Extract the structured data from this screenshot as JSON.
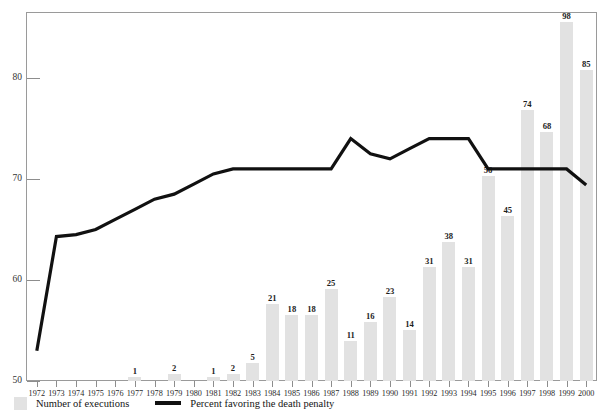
{
  "figure": {
    "top_strip_text": "",
    "background_color": "#ffffff",
    "frame_color": "#9a9a9a"
  },
  "legend": {
    "bar_swatch_name": "executions-swatch",
    "bar_label": "Number of executions",
    "line_swatch_name": "percent-line-swatch",
    "line_label": "Percent favoring the death penalty"
  },
  "colors": {
    "bar_fill": "#e2e2e2",
    "line_stroke": "#111111",
    "axis": "#8d8d8d",
    "text": "#1d1d1d"
  },
  "chart_data": {
    "type": "bar",
    "title": "",
    "subtitle": "",
    "xlabel": "",
    "ylabel": "",
    "grid": false,
    "legend_position": "bottom-left",
    "ylim": [
      50,
      86.5
    ],
    "yticks": [
      50,
      60,
      70,
      80
    ],
    "ytick_labels": [
      "50",
      "60",
      "70",
      "80"
    ],
    "categories": [
      "1972",
      "1973",
      "1974",
      "1975",
      "1976",
      "1977",
      "1978",
      "1979",
      "1980",
      "1981",
      "1982",
      "1983",
      "1984",
      "1985",
      "1986",
      "1987",
      "1988",
      "1989",
      "1990",
      "1991",
      "1992",
      "1993",
      "1994",
      "1995",
      "1996",
      "1997",
      "1998",
      "1999",
      "2000"
    ],
    "series": [
      {
        "name": "Number of executions",
        "type": "bar",
        "axis": "count",
        "values": [
          0,
          0,
          0,
          0,
          0,
          1,
          0,
          2,
          0,
          1,
          2,
          5,
          21,
          18,
          18,
          25,
          11,
          16,
          23,
          14,
          31,
          38,
          31,
          56,
          45,
          74,
          68,
          98,
          85
        ],
        "labels": [
          "",
          "",
          "",
          "",
          "",
          "1",
          "",
          "2",
          "",
          "1",
          "2",
          "5",
          "21",
          "18",
          "18",
          "25",
          "11",
          "16",
          "23",
          "14",
          "31",
          "38",
          "31",
          "56",
          "45",
          "74",
          "68",
          "98",
          "85"
        ]
      },
      {
        "name": "Percent favoring the death penalty",
        "type": "line",
        "axis": "percent",
        "values": [
          53,
          64.3,
          64.5,
          65,
          66,
          67,
          68,
          68.5,
          69.5,
          70.5,
          71,
          71,
          71,
          71,
          71,
          71,
          74,
          72.5,
          72,
          73,
          74,
          74,
          74,
          71,
          71,
          71,
          71,
          71,
          69.4
        ]
      }
    ]
  }
}
